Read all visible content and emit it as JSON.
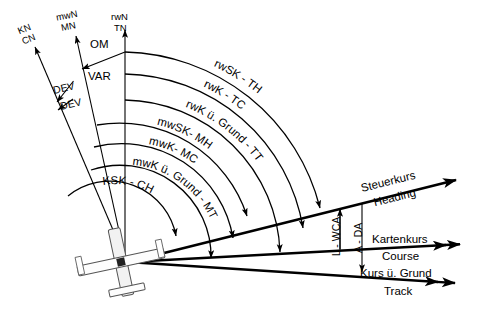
{
  "figure": {
    "background": "#ffffff",
    "stroke": "#000000"
  },
  "north_references": [
    {
      "id": "compass-north",
      "line1": "KN",
      "line2": "CN"
    },
    {
      "id": "magnetic-north",
      "line1": "mwN",
      "line2": "MN"
    },
    {
      "id": "true-north",
      "line1": "rwN",
      "line2": "TN"
    }
  ],
  "angle_offsets": [
    {
      "id": "deviation-upper",
      "label": "DEV"
    },
    {
      "id": "deviation-lower",
      "label": "DEV"
    },
    {
      "id": "variation-om",
      "label": "OM"
    },
    {
      "id": "variation-var",
      "label": "VAR"
    },
    {
      "id": "wind-correction-angle",
      "label": "L - WCA"
    },
    {
      "id": "drift-angle",
      "label": "A - DA"
    }
  ],
  "arcs": [
    {
      "id": "arc-true-heading",
      "label": "rwSK - TH"
    },
    {
      "id": "arc-true-course",
      "label": "rwK - TC"
    },
    {
      "id": "arc-true-track",
      "label": "rwK ü. Grund - TT"
    },
    {
      "id": "arc-magnetic-heading",
      "label": "mwSK- MH"
    },
    {
      "id": "arc-magnetic-course",
      "label": "mwK- MC"
    },
    {
      "id": "arc-magnetic-track",
      "label": "mwK ü. Grund - MT"
    },
    {
      "id": "arc-compass-heading",
      "label": "KSK - CH"
    }
  ],
  "vectors": [
    {
      "id": "heading-vector",
      "german": "Steuerkurs",
      "english": "Heading"
    },
    {
      "id": "course-vector",
      "german": "Kartenkurs",
      "english": "Course"
    },
    {
      "id": "track-vector",
      "german": "Kurs ü. Grund",
      "english": "Track"
    }
  ],
  "aircraft": {
    "id": "aircraft-symbol",
    "label": "aircraft"
  }
}
